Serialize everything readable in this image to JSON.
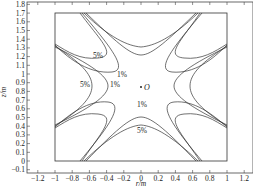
{
  "chart_data": {
    "type": "line",
    "title": "",
    "xlabel": "r/m",
    "ylabel": "z/m",
    "xlim": [
      -1.3,
      1.3
    ],
    "ylim": [
      -0.1,
      1.85
    ],
    "xticks": [
      "-1.2",
      "-1",
      "-0.8",
      "-0.6",
      "-0.4",
      "-0.2",
      "0",
      "0.2",
      "0.4",
      "0.6",
      "0.8",
      "1",
      "1.2"
    ],
    "yticks": [
      "-0.1",
      "0",
      "0.1",
      "0.2",
      "0.3",
      "0.4",
      "0.5",
      "0.6",
      "0.7",
      "0.8",
      "0.9",
      "1",
      "1.1",
      "1.2",
      "1.3",
      "1.4",
      "1.5",
      "1.6",
      "1.7",
      "1.8"
    ],
    "grid": false,
    "legend": "none",
    "boundary_box": {
      "r": [
        -1,
        1
      ],
      "z": [
        0,
        1.7
      ]
    },
    "center_point": {
      "label": "O",
      "r": 0,
      "z": 0.85
    },
    "annotations": [
      {
        "text": "5%",
        "r": -0.5,
        "z": 1.23
      },
      {
        "text": "1%",
        "r": -0.12,
        "z": 1.0
      },
      {
        "text": "5%",
        "r": -0.75,
        "z": 0.85
      },
      {
        "text": "1%",
        "r": -0.3,
        "z": 0.85
      },
      {
        "text": "1%",
        "r": 0.0,
        "z": 0.63
      },
      {
        "text": "5%",
        "r": 0.0,
        "z": 0.3
      }
    ],
    "series": [
      {
        "name": "5% contour",
        "description": "four hyperbola-like level curves emanating from the box corners, nearest the center side of each wall region"
      },
      {
        "name": "1% contour",
        "description": "four hyperbola-like level curves closer to the center O"
      }
    ]
  }
}
